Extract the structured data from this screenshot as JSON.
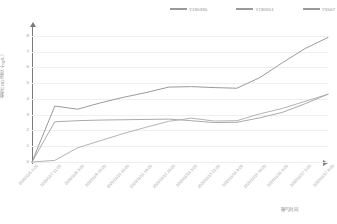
{
  "legend": {
    "items": [
      {
        "label": "Y190330",
        "color": "#9a9a9a"
      },
      {
        "label": "Y190551",
        "color": "#9a9a9a"
      },
      {
        "label": "Y5567",
        "color": "#9a9a9a"
      }
    ]
  },
  "axes": {
    "ylabel": "剩余COD浓度（mg/L）",
    "xlabel": "曝气时间",
    "yticks": [
      "0",
      "1",
      "2",
      "3",
      "4",
      "5",
      "6",
      "7",
      "8"
    ],
    "xticks": [
      "2020/11/6 0:00",
      "2020/11/7 11:00",
      "2020/11/8 3:00",
      "2020/11/9 15:00",
      "2020/11/10 10:00",
      "2020/11/11 18:00",
      "2020/11/12 19:00",
      "2020/11/13 3:00",
      "2020/11/13 22:00",
      "2020/11/14 8:00",
      "2020/11/15 19:00",
      "2020/11/16 9:00",
      "2020/11/17 0:00",
      "2020/11/17 8:00"
    ]
  },
  "chart_data": {
    "type": "line",
    "title": "",
    "xlabel": "曝气时间",
    "ylabel": "剩余COD浓度（mg/L）",
    "ylim": [
      0,
      8.5
    ],
    "grid": true,
    "legend_position": "top-right",
    "x": [
      "2020/11/6 0:00",
      "2020/11/7 11:00",
      "2020/11/8 3:00",
      "2020/11/9 15:00",
      "2020/11/10 10:00",
      "2020/11/11 18:00",
      "2020/11/12 19:00",
      "2020/11/13 3:00",
      "2020/11/13 22:00",
      "2020/11/14 8:00",
      "2020/11/15 19:00",
      "2020/11/16 9:00",
      "2020/11/17 0:00",
      "2020/11/17 8:00"
    ],
    "series": [
      {
        "name": "Y190330",
        "color": "#8f8f8f",
        "values": [
          0.0,
          3.55,
          3.35,
          3.75,
          4.1,
          4.4,
          4.75,
          4.78,
          4.72,
          4.68,
          5.35,
          6.3,
          7.2,
          7.9
        ]
      },
      {
        "name": "Y190551",
        "color": "#a0a0a0",
        "values": [
          0.0,
          2.55,
          2.62,
          2.66,
          2.68,
          2.7,
          2.72,
          2.62,
          2.5,
          2.52,
          2.8,
          3.15,
          3.7,
          4.3
        ]
      },
      {
        "name": "Y5567",
        "color": "#aaaaaa",
        "values": [
          0.0,
          0.1,
          0.9,
          1.35,
          1.8,
          2.2,
          2.58,
          2.78,
          2.6,
          2.62,
          3.05,
          3.4,
          3.85,
          4.3
        ]
      }
    ]
  }
}
